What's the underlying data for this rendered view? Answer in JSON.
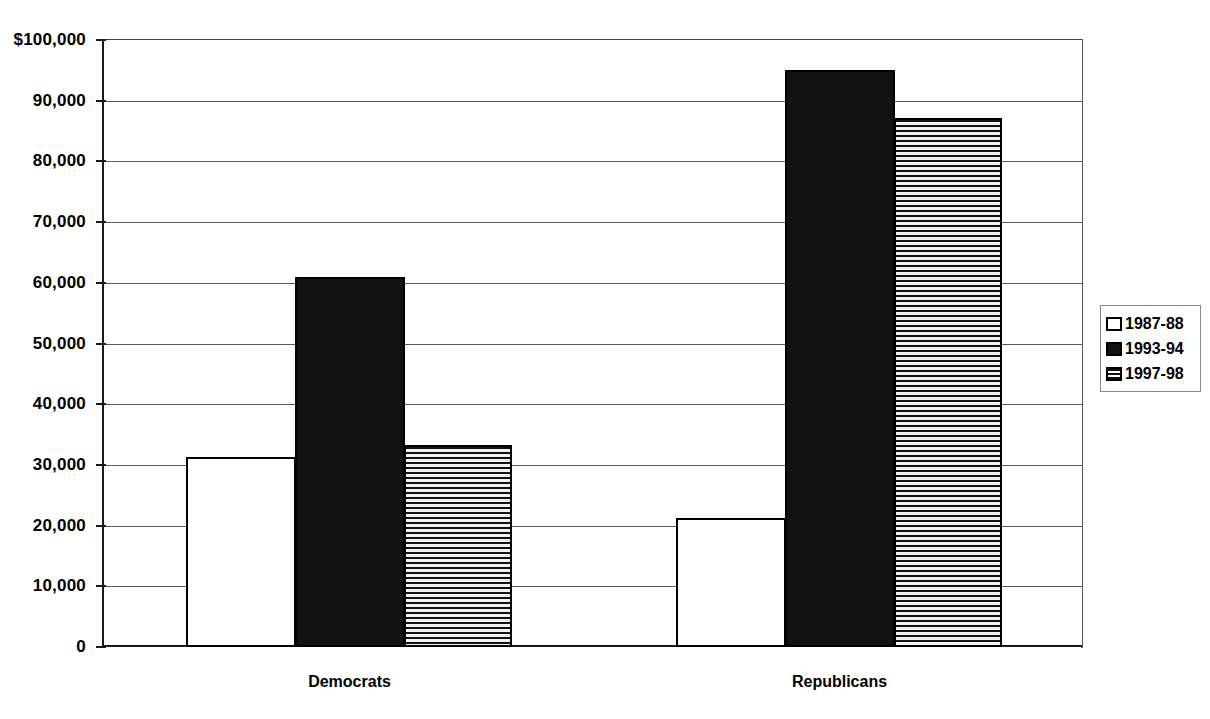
{
  "chart_data": {
    "type": "bar",
    "title": "",
    "subtitle": "",
    "xlabel": "",
    "ylabel": "",
    "categories": [
      "Democrats",
      "Republicans"
    ],
    "series": [
      {
        "name": "1987-88",
        "pattern": "empty",
        "values": [
          31300,
          21200
        ]
      },
      {
        "name": "1993-94",
        "pattern": "solid",
        "values": [
          61000,
          95000
        ]
      },
      {
        "name": "1997-98",
        "pattern": "hstripe",
        "values": [
          33200,
          87200
        ]
      }
    ],
    "ylim": [
      0,
      100000
    ],
    "ytick_values": [
      0,
      10000,
      20000,
      30000,
      40000,
      50000,
      60000,
      70000,
      80000,
      90000,
      100000
    ],
    "ytick_labels": [
      "0",
      "10,000",
      "20,000",
      "30,000",
      "40,000",
      "50,000",
      "60,000",
      "70,000",
      "80,000",
      "90,000",
      "$100,000"
    ],
    "grid": true,
    "grid_axis": "y",
    "legend_position": "right",
    "bar_group_gap": true,
    "colors": {
      "axis": "#1a1a1a",
      "gridline": "#5a5a5a",
      "bar_outline": "#000000",
      "bar_solid": "#121212",
      "bar_empty": "#ffffff",
      "background": "#ffffff",
      "legend_border": "#8a8a8a"
    }
  },
  "legend": {
    "items": [
      {
        "label": "1987-88",
        "swatch": "legend-swatch-empty"
      },
      {
        "label": "1993-94",
        "swatch": "legend-swatch-solid"
      },
      {
        "label": "1997-98",
        "swatch": "legend-swatch-hstripe"
      }
    ]
  },
  "axis": {
    "y_labels": [
      "$100,000",
      "90,000",
      "80,000",
      "70,000",
      "60,000",
      "50,000",
      "40,000",
      "30,000",
      "20,000",
      "10,000",
      "0"
    ],
    "x_labels": [
      "Democrats",
      "Republicans"
    ]
  }
}
